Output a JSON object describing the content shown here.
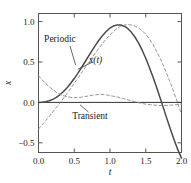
{
  "figure": {
    "background_color": "#ffffff",
    "frame_color": "#555555",
    "curve_color": "#4a4a4a",
    "dashed_color": "#8a8a8a",
    "text_color": "#1a1a1a"
  },
  "chart_data": {
    "type": "line",
    "title": "",
    "xlabel": "t",
    "ylabel": "x",
    "xlim": [
      0.0,
      2.0
    ],
    "ylim": [
      -0.62,
      1.1
    ],
    "grid": false,
    "legend": "none",
    "xticks": [
      0.0,
      0.5,
      1.0,
      1.5,
      2.0
    ],
    "xtick_labels": [
      "0.0",
      "0.5",
      "1.0",
      "1.5",
      "2.0"
    ],
    "yticks": [
      -0.5,
      0.0,
      0.5,
      1.0
    ],
    "ytick_labels": [
      "-0.5",
      "0.0",
      "0.5",
      "1.0"
    ],
    "annotations": [
      {
        "text": "Periodic",
        "x": 0.3,
        "y": 0.78,
        "style": "upright"
      },
      {
        "text": "x(t)",
        "x": 0.8,
        "y": 0.52,
        "style": "italic"
      },
      {
        "text": "Transient",
        "x": 0.72,
        "y": -0.17,
        "style": "upright"
      }
    ],
    "series": [
      {
        "name": "x(t)",
        "style": "solid",
        "x": [
          0.0,
          0.05,
          0.1,
          0.15,
          0.2,
          0.25,
          0.3,
          0.35,
          0.4,
          0.45,
          0.5,
          0.55,
          0.6,
          0.65,
          0.7,
          0.75,
          0.8,
          0.85,
          0.9,
          0.95,
          1.0,
          1.05,
          1.1,
          1.15,
          1.2,
          1.25,
          1.3,
          1.35,
          1.4,
          1.45,
          1.5,
          1.55,
          1.6,
          1.65,
          1.7,
          1.75,
          1.8,
          1.85,
          1.9,
          1.95,
          2.0
        ],
        "y": [
          0.0,
          0.002,
          0.008,
          0.02,
          0.038,
          0.063,
          0.095,
          0.135,
          0.182,
          0.236,
          0.295,
          0.36,
          0.429,
          0.5,
          0.572,
          0.643,
          0.711,
          0.775,
          0.832,
          0.881,
          0.92,
          0.946,
          0.959,
          0.958,
          0.943,
          0.912,
          0.867,
          0.807,
          0.733,
          0.646,
          0.546,
          0.436,
          0.317,
          0.19,
          0.058,
          -0.077,
          -0.213,
          -0.346,
          -0.472,
          -0.588,
          -0.69
        ]
      },
      {
        "name": "Periodic",
        "style": "dashed",
        "x": [
          0.0,
          0.05,
          0.1,
          0.15,
          0.2,
          0.25,
          0.3,
          0.35,
          0.4,
          0.45,
          0.5,
          0.55,
          0.6,
          0.65,
          0.7,
          0.75,
          0.8,
          0.85,
          0.9,
          0.95,
          1.0,
          1.05,
          1.1,
          1.15,
          1.2,
          1.25,
          1.3,
          1.35,
          1.4,
          1.45,
          1.5,
          1.55,
          1.6,
          1.65,
          1.7,
          1.75,
          1.8,
          1.85,
          1.9,
          1.95,
          2.0
        ],
        "y": [
          -0.33,
          -0.278,
          -0.226,
          -0.173,
          -0.119,
          -0.063,
          -0.006,
          0.052,
          0.112,
          0.173,
          0.236,
          0.3,
          0.364,
          0.428,
          0.492,
          0.555,
          0.617,
          0.677,
          0.734,
          0.787,
          0.836,
          0.879,
          0.915,
          0.941,
          0.957,
          0.962,
          0.958,
          0.945,
          0.922,
          0.888,
          0.843,
          0.786,
          0.717,
          0.637,
          0.547,
          0.449,
          0.343,
          0.23,
          0.11,
          -0.015,
          -0.145
        ]
      },
      {
        "name": "Transient",
        "style": "dashed",
        "x": [
          0.0,
          0.05,
          0.1,
          0.15,
          0.2,
          0.25,
          0.3,
          0.35,
          0.4,
          0.45,
          0.5,
          0.55,
          0.6,
          0.65,
          0.7,
          0.75,
          0.8,
          0.85,
          0.9,
          0.95,
          1.0,
          1.1,
          1.2,
          1.3,
          1.4,
          1.5,
          1.6,
          1.7,
          1.8,
          1.9,
          2.0
        ],
        "y": [
          0.33,
          0.28,
          0.234,
          0.193,
          0.157,
          0.126,
          0.101,
          0.083,
          0.07,
          0.063,
          0.059,
          0.06,
          0.065,
          0.072,
          0.08,
          0.088,
          0.094,
          0.098,
          0.098,
          0.094,
          0.084,
          0.067,
          0.044,
          0.019,
          -0.004,
          -0.022,
          -0.033,
          -0.038,
          -0.037,
          -0.031,
          -0.022
        ]
      }
    ]
  }
}
